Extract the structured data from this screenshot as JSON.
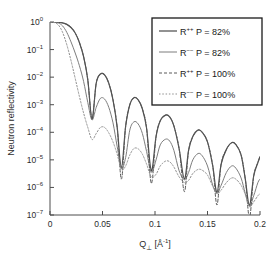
{
  "chart_data": {
    "type": "line",
    "title": "",
    "xlabel": "Q⊥ [Å⁻¹]",
    "ylabel": "Neutron reflectivity",
    "xlim": [
      0,
      0.2
    ],
    "ylim": [
      1e-07,
      1
    ],
    "yscale": "log",
    "xscale": "linear",
    "grid": false,
    "legend_position": "upper-right",
    "xticks": [
      "0",
      "0.05",
      "0.1",
      "0.15",
      "0.2"
    ],
    "xtick_values": [
      0,
      0.05,
      0.1,
      0.15,
      0.2
    ],
    "yticks": [
      "10^0",
      "10^-1",
      "10^-2",
      "10^-3",
      "10^-4",
      "10^-5",
      "10^-6",
      "10^-7"
    ],
    "ytick_exponents": [
      0,
      -1,
      -2,
      -3,
      -4,
      -5,
      -6,
      -7
    ],
    "fringe_minima_q": [
      0.04,
      0.068,
      0.097,
      0.128,
      0.159,
      0.19
    ],
    "series": [
      {
        "name": "R++ P = 82%",
        "symbol": "R",
        "superscript": "++",
        "polarization": "82%",
        "style": "solid",
        "color": "#4a4a4a",
        "width": 1.2,
        "x": [
          0.0,
          0.004,
          0.008,
          0.012,
          0.016,
          0.02,
          0.024,
          0.028,
          0.032,
          0.036,
          0.04,
          0.044,
          0.048,
          0.052,
          0.056,
          0.06,
          0.064,
          0.068,
          0.072,
          0.076,
          0.08,
          0.084,
          0.088,
          0.092,
          0.0965,
          0.101,
          0.105,
          0.11,
          0.114,
          0.118,
          0.123,
          0.128,
          0.132,
          0.136,
          0.141,
          0.145,
          0.15,
          0.155,
          0.159,
          0.163,
          0.168,
          0.173,
          0.177,
          0.182,
          0.186,
          0.19,
          0.194,
          0.198,
          0.2
        ],
        "y": [
          1.0,
          1.0,
          0.98,
          0.93,
          0.82,
          0.63,
          0.4,
          0.18,
          0.055,
          0.008,
          0.0003,
          0.006,
          0.013,
          0.012,
          0.006,
          0.0015,
          0.00015,
          5e-06,
          0.00016,
          0.001,
          0.0018,
          0.0015,
          0.0007,
          0.00014,
          4e-06,
          7e-05,
          0.00026,
          0.00042,
          0.00036,
          0.00017,
          2.5e-05,
          2e-06,
          2.2e-05,
          7e-05,
          0.00012,
          0.0001,
          4.5e-05,
          6e-06,
          6.5e-07,
          7e-06,
          2.4e-05,
          4.2e-05,
          3.6e-05,
          1.5e-05,
          2e-06,
          2.2e-07,
          2.6e-06,
          8e-06,
          1.3e-05
        ]
      },
      {
        "name": "R-- P = 82%",
        "symbol": "R",
        "superscript": "--",
        "polarization": "82%",
        "style": "solid",
        "color": "#7d7d7d",
        "width": 1.0,
        "x": [
          0.0,
          0.004,
          0.008,
          0.012,
          0.016,
          0.02,
          0.024,
          0.028,
          0.032,
          0.036,
          0.04,
          0.044,
          0.048,
          0.052,
          0.056,
          0.06,
          0.064,
          0.068,
          0.072,
          0.076,
          0.08,
          0.084,
          0.088,
          0.092,
          0.0965,
          0.101,
          0.105,
          0.11,
          0.114,
          0.118,
          0.123,
          0.128,
          0.132,
          0.136,
          0.141,
          0.145,
          0.15,
          0.155,
          0.159,
          0.163,
          0.168,
          0.173,
          0.177,
          0.182,
          0.186,
          0.19,
          0.194,
          0.198,
          0.2
        ],
        "y": [
          1.0,
          0.99,
          0.92,
          0.72,
          0.42,
          0.19,
          0.075,
          0.026,
          0.007,
          0.0012,
          0.00028,
          0.0008,
          0.0017,
          0.0016,
          0.0008,
          0.00022,
          3e-05,
          5e-06,
          1.2e-05,
          0.00012,
          0.00024,
          0.0002,
          9e-05,
          2e-05,
          3.6e-06,
          1e-05,
          3.5e-05,
          5.6e-05,
          4.8e-05,
          2.2e-05,
          4e-06,
          1.9e-06,
          3.5e-06,
          1e-05,
          1.7e-05,
          1.4e-05,
          6e-06,
          1.2e-06,
          6.2e-07,
          1.2e-06,
          3.5e-06,
          6e-06,
          5e-06,
          2.2e-06,
          6e-07,
          2.1e-07,
          5e-07,
          1.5e-06,
          2e-06
        ]
      },
      {
        "name": "R++ P = 100%",
        "symbol": "R",
        "superscript": "++",
        "polarization": "100%",
        "style": "dashed",
        "color": "#5a5a5a",
        "width": 1.0,
        "x": [
          0.0,
          0.004,
          0.008,
          0.012,
          0.016,
          0.02,
          0.024,
          0.028,
          0.032,
          0.036,
          0.04,
          0.044,
          0.048,
          0.052,
          0.056,
          0.06,
          0.064,
          0.068,
          0.072,
          0.076,
          0.08,
          0.084,
          0.088,
          0.092,
          0.0965,
          0.101,
          0.105,
          0.11,
          0.114,
          0.118,
          0.123,
          0.128,
          0.132,
          0.136,
          0.141,
          0.145,
          0.15,
          0.155,
          0.159,
          0.163,
          0.168,
          0.173,
          0.177,
          0.182,
          0.186,
          0.19,
          0.194,
          0.198,
          0.2
        ],
        "y": [
          1.0,
          1.0,
          0.98,
          0.93,
          0.82,
          0.63,
          0.4,
          0.18,
          0.055,
          0.008,
          0.0003,
          0.006,
          0.013,
          0.012,
          0.006,
          0.0015,
          0.00015,
          2e-06,
          0.00016,
          0.001,
          0.0018,
          0.0015,
          0.0007,
          0.00014,
          1.4e-06,
          7e-05,
          0.00026,
          0.00042,
          0.00036,
          0.00017,
          2.5e-05,
          7e-07,
          2.2e-05,
          7e-05,
          0.00012,
          0.0001,
          4.5e-05,
          6e-06,
          2.3e-07,
          7e-06,
          2.4e-05,
          4.2e-05,
          3.6e-05,
          1.5e-05,
          2e-06,
          8e-08,
          2.6e-06,
          8e-06,
          1.3e-05
        ]
      },
      {
        "name": "R-- P = 100%",
        "symbol": "R",
        "superscript": "--",
        "polarization": "100%",
        "style": "dotted",
        "color": "#8f8f8f",
        "width": 1.0,
        "x": [
          0.0,
          0.004,
          0.008,
          0.012,
          0.016,
          0.02,
          0.024,
          0.028,
          0.032,
          0.036,
          0.04,
          0.044,
          0.048,
          0.052,
          0.056,
          0.06,
          0.064,
          0.068,
          0.072,
          0.076,
          0.08,
          0.084,
          0.088,
          0.092,
          0.0965,
          0.101,
          0.105,
          0.11,
          0.114,
          0.118,
          0.123,
          0.128,
          0.132,
          0.136,
          0.141,
          0.145,
          0.15,
          0.155,
          0.159,
          0.163,
          0.168,
          0.173,
          0.177,
          0.182,
          0.186,
          0.19,
          0.194,
          0.198,
          0.2
        ],
        "y": [
          1.0,
          0.96,
          0.78,
          0.42,
          0.15,
          0.04,
          0.009,
          0.002,
          0.0005,
          0.00015,
          5.5e-05,
          9e-05,
          0.00015,
          0.00015,
          9.5e-05,
          4.5e-05,
          1.6e-05,
          4.5e-06,
          6e-06,
          1.5e-05,
          2.6e-05,
          2.5e-05,
          1.6e-05,
          7e-06,
          2.4e-06,
          3e-06,
          6e-06,
          9e-06,
          8.5e-06,
          5.5e-06,
          2.4e-06,
          1.5e-06,
          1.8e-06,
          3.2e-06,
          4.5e-06,
          4.2e-06,
          2.8e-06,
          1.1e-06,
          6e-07,
          8e-07,
          1.5e-06,
          2.2e-06,
          2e-06,
          1.2e-06,
          5.5e-07,
          2e-07,
          3e-07,
          5e-07,
          6e-07
        ]
      }
    ],
    "legend_entries": [
      {
        "label": "R++ P = 82%",
        "base": "R",
        "sup": "++",
        "rest": " P = 82%",
        "style": "solid",
        "color": "#4a4a4a"
      },
      {
        "label": "R-- P = 82%",
        "base": "R",
        "sup": "−−",
        "rest": " P = 82%",
        "style": "solid",
        "color": "#7d7d7d"
      },
      {
        "label": "R++ P = 100%",
        "base": "R",
        "sup": "++",
        "rest": " P = 100%",
        "style": "dashed",
        "color": "#5a5a5a"
      },
      {
        "label": "R-- P = 100%",
        "base": "R",
        "sup": "−−",
        "rest": " P = 100%",
        "style": "dotted",
        "color": "#8f8f8f"
      }
    ]
  },
  "axes": {
    "ylabel": "Neutron reflectivity",
    "xlabel_base": "Q",
    "xlabel_sub": "⊥",
    "xlabel_unit": "[Å",
    "xlabel_unit_sup": "-1",
    "xlabel_unit_close": "]"
  },
  "colors": {
    "axis": "#4d4d4d",
    "text": "#1a1a1a",
    "legend_border": "#1a1a1a",
    "background": "#ffffff"
  }
}
